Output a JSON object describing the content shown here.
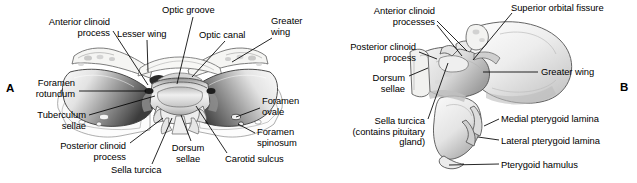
{
  "figure": {
    "background_color": "#ffffff",
    "ink_color": "#000000",
    "bone_fill": "#f2f1ef",
    "bone_shade": "#6f6f6f"
  },
  "panels": [
    {
      "id": "A",
      "letter": "A",
      "view": "superior view of sphenoid bone",
      "letter_pos": {
        "x": 6,
        "y": 82
      }
    },
    {
      "id": "B",
      "letter": "B",
      "view": "oblique posterior view of sphenoid bone",
      "letter_pos": {
        "x": 620,
        "y": 81
      }
    }
  ],
  "labels_panel_a": [
    {
      "name": "anterior-clinoid-process",
      "text": "Anterior clinoid\nprocess",
      "align": "right",
      "x": 18,
      "y": 17,
      "width": 92,
      "leader": [
        [
          113,
          31
        ],
        [
          148,
          85
        ]
      ]
    },
    {
      "name": "lesser-wing",
      "text": "Lesser wing",
      "align": "left",
      "x": 117,
      "y": 29,
      "width": 60,
      "leader": [
        [
          147,
          40
        ],
        [
          148,
          72
        ]
      ]
    },
    {
      "name": "optic-groove",
      "text": "Optic groove",
      "align": "left",
      "x": 162,
      "y": 5,
      "width": 66,
      "leader": [
        [
          193,
          17
        ],
        [
          177,
          84
        ]
      ]
    },
    {
      "name": "optic-canal",
      "text": "Optic canal",
      "align": "left",
      "x": 199,
      "y": 30,
      "width": 58,
      "leader": [
        [
          225,
          41
        ],
        [
          192,
          77
        ]
      ]
    },
    {
      "name": "greater-wing",
      "text": "Greater\nwing",
      "align": "left",
      "x": 271,
      "y": 16,
      "width": 48,
      "leader": [
        [
          272,
          38
        ],
        [
          232,
          62
        ]
      ]
    },
    {
      "name": "foramen-rotundum",
      "text": "Foramen\nrotundum",
      "align": "right",
      "x": 17,
      "y": 78,
      "width": 58,
      "leader": [
        [
          79,
          91
        ],
        [
          146,
          91
        ]
      ]
    },
    {
      "name": "tuberculum-sellae",
      "text": "Tuberculum\nsellae",
      "align": "right",
      "x": 17,
      "y": 110,
      "width": 69,
      "leader": [
        [
          89,
          115
        ],
        [
          155,
          96
        ]
      ]
    },
    {
      "name": "posterior-clinoid-process",
      "text": "Posterior clinoid\nprocess",
      "align": "right",
      "x": 38,
      "y": 141,
      "width": 88,
      "leader": [
        [
          130,
          143
        ],
        [
          163,
          118
        ]
      ]
    },
    {
      "name": "sella-turcica",
      "text": "Sella turcica",
      "align": "left",
      "x": 111,
      "y": 165,
      "width": 64,
      "leader": [
        [
          152,
          164
        ],
        [
          172,
          118
        ]
      ]
    },
    {
      "name": "dorsum-sellae",
      "text": "Dorsum\nsellae",
      "align": "center",
      "x": 164,
      "y": 143,
      "width": 48,
      "leader": [
        [
          191,
          141
        ],
        [
          181,
          115
        ]
      ]
    },
    {
      "name": "carotid-sulcus",
      "text": "Carotid sulcus",
      "align": "left",
      "x": 225,
      "y": 154,
      "width": 72,
      "leader": [
        [
          227,
          153
        ],
        [
          196,
          106
        ]
      ]
    },
    {
      "name": "foramen-ovale",
      "text": "Foramen\novale",
      "align": "left",
      "x": 262,
      "y": 96,
      "width": 52,
      "leader": [
        [
          260,
          108
        ],
        [
          236,
          117
        ]
      ]
    },
    {
      "name": "foramen-spinosum",
      "text": "Foramen\nspinosum",
      "align": "left",
      "x": 257,
      "y": 127,
      "width": 58,
      "leader": [
        [
          255,
          133
        ],
        [
          238,
          124
        ]
      ]
    }
  ],
  "labels_panel_b": [
    {
      "name": "anterior-clinoid-processes",
      "text": "Anterior clinoid\nprocesses",
      "align": "right",
      "x": 345,
      "y": 6,
      "width": 90,
      "leader": [
        [
          437,
          21
        ],
        [
          467,
          51
        ]
      ],
      "leader2": [
        [
          437,
          25
        ],
        [
          462,
          56
        ]
      ]
    },
    {
      "name": "superior-orbital-fissure",
      "text": "Superior orbital fissure",
      "align": "left",
      "x": 511,
      "y": 3,
      "width": 112,
      "leader": [
        [
          512,
          13
        ],
        [
          473,
          60
        ]
      ]
    },
    {
      "name": "posterior-clinoid-process",
      "text": "Posterior clinoid\nprocess",
      "align": "right",
      "x": 328,
      "y": 42,
      "width": 88,
      "leader": [
        [
          419,
          52
        ],
        [
          437,
          59
        ]
      ]
    },
    {
      "name": "dorsum-sellae",
      "text": "Dorsum\nsellae",
      "align": "right",
      "x": 355,
      "y": 73,
      "width": 50,
      "leader": [
        [
          409,
          76
        ],
        [
          428,
          68
        ]
      ]
    },
    {
      "name": "sella-turcica",
      "text": "Sella turcica\n(contains pituitary\ngland)",
      "align": "right",
      "x": 323,
      "y": 116,
      "width": 102,
      "leader": [
        [
          428,
          119
        ],
        [
          448,
          63
        ]
      ]
    },
    {
      "name": "greater-wing",
      "text": "Greater wing",
      "align": "left",
      "x": 541,
      "y": 67,
      "width": 66,
      "leader": [
        [
          538,
          72
        ],
        [
          483,
          72
        ]
      ]
    },
    {
      "name": "medial-pterygoid-lamina",
      "text": "Medial pterygoid lamina",
      "align": "left",
      "x": 501,
      "y": 114,
      "width": 116,
      "leader": [
        [
          499,
          119
        ],
        [
          484,
          126
        ]
      ]
    },
    {
      "name": "lateral-pterygoid-lamina",
      "text": "Lateral pterygoid lamina",
      "align": "left",
      "x": 501,
      "y": 136,
      "width": 117,
      "leader": [
        [
          499,
          140
        ],
        [
          478,
          137
        ]
      ]
    },
    {
      "name": "pterygoid-hamulus",
      "text": "Pterygoid hamulus",
      "align": "left",
      "x": 501,
      "y": 160,
      "width": 92,
      "leader": [
        [
          499,
          164
        ],
        [
          449,
          165
        ]
      ]
    }
  ]
}
